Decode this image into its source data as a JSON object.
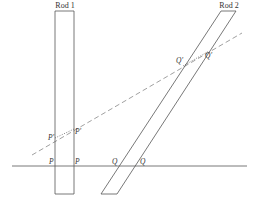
{
  "rods": [
    {
      "id": "rod1",
      "label": "Rod 1",
      "points": "55,11 74,11 74,194 55,194",
      "label_x": 65,
      "label_y": 8
    },
    {
      "id": "rod2",
      "label": "Rod 2",
      "points": "221,11 236,11 117,194 101,194",
      "label_x": 229,
      "label_y": 8
    }
  ],
  "lines": {
    "horizontal": {
      "x1": 12,
      "y1": 166,
      "x2": 247,
      "y2": 166
    },
    "dashed": {
      "x1": 32,
      "y1": 155,
      "x2": 242,
      "y2": 33
    },
    "dotted_segments": [
      {
        "x1": 55,
        "y1": 138,
        "x2": 74,
        "y2": 129
      },
      {
        "x1": 183,
        "y1": 66,
        "x2": 209,
        "y2": 51
      }
    ]
  },
  "points": [
    {
      "label": "P",
      "x": 49,
      "y": 164
    },
    {
      "label": "P",
      "x": 75,
      "y": 164
    },
    {
      "label": "Q",
      "x": 112,
      "y": 164
    },
    {
      "label": "Q",
      "x": 140,
      "y": 164
    },
    {
      "label": "P'",
      "x": 48,
      "y": 140
    },
    {
      "label": "P'",
      "x": 75,
      "y": 134
    },
    {
      "label": "Q'",
      "x": 176,
      "y": 63
    },
    {
      "label": "Q'",
      "x": 205,
      "y": 58
    }
  ],
  "colors": {
    "stroke": "#555555",
    "dashed": "#888888",
    "text": "#333333"
  }
}
